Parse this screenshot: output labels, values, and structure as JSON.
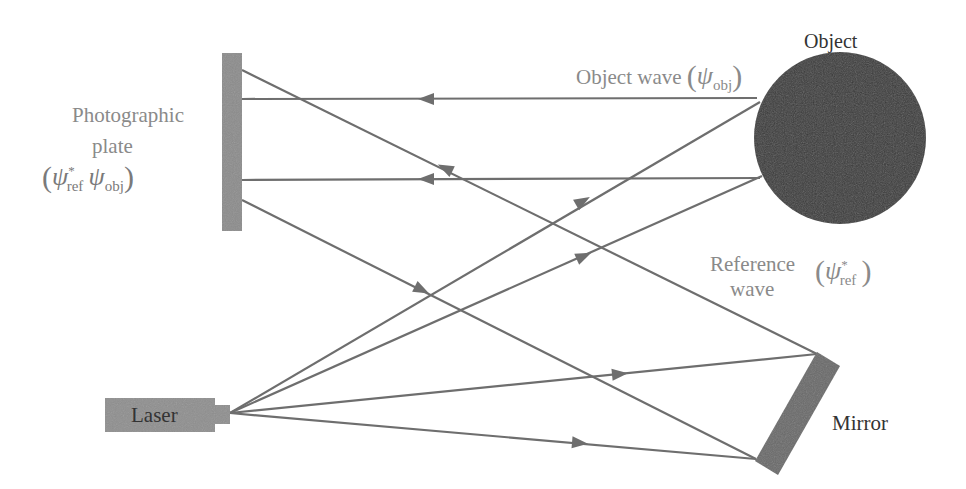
{
  "diagram": {
    "colors": {
      "background": "#ffffff",
      "beam": "#6e6e6e",
      "plate": "#8c8c8c",
      "laser_body": "#8f8f8f",
      "object": "#3a3a3a",
      "mirror": "#6a6a6a",
      "label_grey": "#8a8a8a",
      "label_dark": "#333333"
    },
    "labels": {
      "object_title": "Object",
      "object_wave": {
        "text": "Object wave",
        "psi": "ψ",
        "sub": "obj"
      },
      "photographic_plate": {
        "line1": "Photographic",
        "line2": "plate",
        "psi1": "ψ",
        "sup1": "*",
        "sub1": "ref",
        "psi2": "ψ",
        "sub2": "obj"
      },
      "reference_wave": {
        "line1": "Reference",
        "line2": "wave",
        "psi": "ψ",
        "sup": "*",
        "sub": "ref"
      },
      "laser": "Laser",
      "mirror": "Mirror"
    },
    "components": {
      "photographic_plate": {
        "x": 222,
        "y": 53,
        "w": 20,
        "h": 178
      },
      "laser": {
        "x": 105,
        "y": 398,
        "w": 110,
        "h": 34,
        "nozzle": {
          "x": 215,
          "y": 405,
          "w": 15,
          "h": 19
        }
      },
      "object": {
        "cx": 840,
        "cy": 138,
        "r": 86
      },
      "mirror": {
        "points": "817,352 840,366 778,475 755,461"
      }
    },
    "beams": [
      {
        "id": "object-wave-upper",
        "x1": 757,
        "y1": 98,
        "x2": 242,
        "y2": 99,
        "arrow": {
          "x": 426,
          "y": 99,
          "dir": "left"
        }
      },
      {
        "id": "object-wave-lower",
        "x1": 760,
        "y1": 178,
        "x2": 242,
        "y2": 180,
        "arrow": {
          "x": 426,
          "y": 179,
          "dir": "left"
        }
      },
      {
        "id": "reference-to-plate",
        "x1": 817,
        "y1": 354,
        "x2": 242,
        "y2": 70,
        "arrow": {
          "x": 445,
          "y": 168,
          "dir": "toward-plate"
        }
      },
      {
        "id": "plate-bottom-diagonal",
        "x1": 242,
        "y1": 200,
        "x2": 756,
        "y2": 459,
        "arrow": {
          "x": 422,
          "y": 290,
          "dir": "toward-plate"
        }
      },
      {
        "id": "laser-to-object-upper",
        "x1": 230,
        "y1": 413,
        "x2": 760,
        "y2": 102,
        "arrow": {
          "x": 583,
          "y": 201,
          "dir": "toward-object"
        }
      },
      {
        "id": "laser-to-object-lower",
        "x1": 230,
        "y1": 413,
        "x2": 762,
        "y2": 176,
        "arrow": {
          "x": 584,
          "y": 256,
          "dir": "toward-object"
        }
      },
      {
        "id": "laser-to-mirror-upper",
        "x1": 230,
        "y1": 413,
        "x2": 817,
        "y2": 354,
        "arrow": {
          "x": 620,
          "y": 374,
          "dir": "toward-mirror"
        }
      },
      {
        "id": "laser-to-mirror-lower",
        "x1": 230,
        "y1": 413,
        "x2": 756,
        "y2": 459,
        "arrow": {
          "x": 580,
          "y": 443,
          "dir": "toward-mirror"
        }
      }
    ]
  }
}
